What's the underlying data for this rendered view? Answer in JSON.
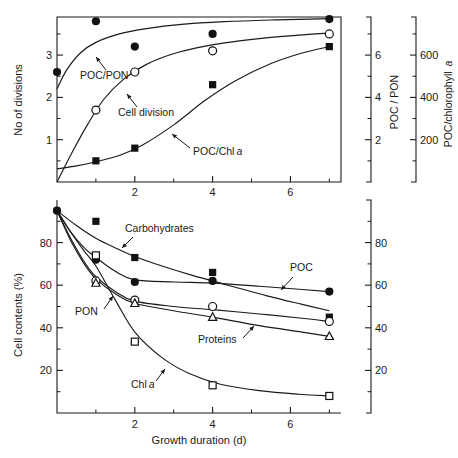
{
  "cut_header_text": "Verity 1981, Fig. 3",
  "figure": {
    "panels": [
      {
        "id": "top",
        "left_axis": {
          "title": "No of divisions",
          "ticks": [
            1,
            2,
            3
          ],
          "range": [
            0,
            3.9
          ]
        },
        "right_axis_1": {
          "title": "POC / PON",
          "ticks": [
            2,
            4,
            6
          ],
          "range": [
            0,
            7.8
          ]
        },
        "right_axis_2": {
          "title": "POC/chlorophyll a",
          "ticks": [
            200,
            400,
            600
          ],
          "range": [
            0,
            780
          ]
        },
        "x_axis": {
          "ticks": [
            2,
            4,
            6
          ],
          "range": [
            0,
            7.3
          ]
        },
        "annotations": [
          {
            "label": "POC/PON"
          },
          {
            "label": "Cell division"
          },
          {
            "label": "POC/Chl a",
            "italic_tail": "a"
          }
        ]
      },
      {
        "id": "bottom",
        "left_axis": {
          "title": "Cell contents (%)",
          "ticks": [
            20,
            40,
            60,
            80
          ],
          "range": [
            0,
            100
          ]
        },
        "right_axis": {
          "title": "",
          "ticks": [
            20,
            40,
            60,
            80
          ],
          "range": [
            0,
            100
          ]
        },
        "x_axis": {
          "title": "Growth duration (d)",
          "ticks": [
            2,
            4,
            6
          ],
          "range": [
            0,
            7.3
          ]
        },
        "annotations": [
          {
            "label": "Carbohydrates"
          },
          {
            "label": "POC"
          },
          {
            "label": "PON"
          },
          {
            "label": "Proteins"
          },
          {
            "label": "Chl a",
            "italic_tail": "a"
          }
        ]
      }
    ]
  },
  "chart_data": [
    {
      "type": "scatter",
      "id": "top-panel",
      "title": "",
      "xlabel": "",
      "ylabel": "No of divisions",
      "xlim": [
        0,
        7.3
      ],
      "ylim": [
        0,
        3.9
      ],
      "xticks": [
        2,
        4,
        6
      ],
      "yticks": [
        1,
        2,
        3
      ],
      "grid": false,
      "legend": "inline-annotations",
      "secondary_axes": [
        {
          "label": "POC / PON",
          "ticks": [
            2,
            4,
            6
          ],
          "lim": [
            0,
            7.8
          ]
        },
        {
          "label": "POC/chlorophyll a",
          "ticks": [
            200,
            400,
            600
          ],
          "lim": [
            0,
            780
          ]
        }
      ],
      "series": [
        {
          "name": "POC/PON",
          "marker": "filled-circle",
          "axis": "POC / PON",
          "x": [
            0,
            1,
            2,
            4,
            7
          ],
          "values": [
            5.2,
            7.6,
            6.4,
            7.0,
            7.7
          ],
          "curve_x": [
            0,
            0.25,
            0.6,
            1,
            1.6,
            2.3,
            3.2,
            4.3,
            5.5,
            6.5,
            7
          ],
          "curve_values": [
            4.4,
            5.3,
            6.1,
            6.6,
            7.0,
            7.25,
            7.45,
            7.58,
            7.66,
            7.7,
            7.72
          ]
        },
        {
          "name": "Cell division",
          "marker": "open-circle",
          "axis": "No of divisions",
          "x": [
            0,
            1,
            2,
            4,
            7
          ],
          "values": [
            0.0,
            1.7,
            2.6,
            3.1,
            3.5
          ],
          "curve_x": [
            0,
            0.4,
            0.8,
            1.2,
            1.7,
            2.3,
            3.1,
            4.1,
            5.2,
            6.2,
            7
          ],
          "curve_values": [
            0.0,
            0.72,
            1.38,
            1.95,
            2.42,
            2.78,
            3.06,
            3.26,
            3.39,
            3.47,
            3.52
          ]
        },
        {
          "name": "POC/Chl a",
          "marker": "filled-square",
          "axis": "POC/chlorophyll a",
          "x": [
            0,
            1,
            2,
            4,
            7
          ],
          "values": [
            40,
            100,
            160,
            460,
            640
          ],
          "curve_x": [
            0,
            0.5,
            1,
            1.6,
            2.2,
            3,
            3.8,
            4.6,
            5.5,
            6.3,
            7
          ],
          "curve_values": [
            62,
            76,
            96,
            125,
            175,
            270,
            385,
            480,
            560,
            610,
            640
          ]
        }
      ]
    },
    {
      "type": "scatter",
      "id": "bottom-panel",
      "title": "",
      "xlabel": "Growth duration (d)",
      "ylabel": "Cell contents (%)",
      "xlim": [
        0,
        7.3
      ],
      "ylim": [
        0,
        100
      ],
      "xticks": [
        2,
        4,
        6
      ],
      "yticks": [
        20,
        40,
        60,
        80
      ],
      "grid": false,
      "legend": "inline-annotations",
      "secondary_axes": [
        {
          "label": "",
          "ticks": [
            20,
            40,
            60,
            80
          ],
          "lim": [
            0,
            100
          ]
        }
      ],
      "series": [
        {
          "name": "Carbohydrates",
          "marker": "filled-square",
          "x": [
            0,
            1,
            2,
            4,
            7
          ],
          "values": [
            95,
            90,
            73,
            66,
            45
          ],
          "curve_x": [
            0,
            0.5,
            1,
            1.5,
            2,
            2.7,
            3.5,
            4.4,
            5.4,
            6.3,
            7
          ],
          "curve_values": [
            95,
            88,
            82,
            77.5,
            73.5,
            69,
            64.5,
            60,
            55,
            51,
            48
          ]
        },
        {
          "name": "POC",
          "marker": "filled-circle",
          "x": [
            0,
            1,
            2,
            4,
            7
          ],
          "values": [
            95,
            72,
            61.5,
            62,
            57
          ],
          "curve_x": [
            0,
            0.35,
            0.7,
            1,
            1.5,
            2,
            3,
            4,
            5.2,
            6.3,
            7
          ],
          "curve_values": [
            95,
            85,
            77.5,
            73,
            66.5,
            62.5,
            61.5,
            61,
            59.5,
            58,
            57
          ]
        },
        {
          "name": "PON",
          "marker": "open-circle",
          "x": [
            0,
            1,
            2,
            4,
            7
          ],
          "values": [
            95,
            62,
            53,
            50,
            43
          ],
          "curve_x": [
            0,
            0.35,
            0.7,
            1,
            1.5,
            2,
            3,
            4,
            5.2,
            6.3,
            7
          ],
          "curve_values": [
            95,
            82,
            71,
            64,
            57,
            52.5,
            50,
            48.5,
            46.5,
            44.5,
            43
          ]
        },
        {
          "name": "Proteins",
          "marker": "open-triangle",
          "x": [
            0,
            1,
            2,
            4,
            7
          ],
          "values": [
            95,
            61,
            51.5,
            45,
            36
          ],
          "curve_x": [
            0,
            0.35,
            0.7,
            1,
            1.5,
            2,
            3,
            4,
            5.2,
            6.3,
            7
          ],
          "curve_values": [
            95,
            81,
            70,
            63,
            56,
            51.5,
            48,
            45,
            41,
            38,
            36
          ]
        },
        {
          "name": "Chl a",
          "marker": "open-square",
          "x": [
            0,
            1,
            2,
            4,
            7
          ],
          "values": [
            95,
            74,
            33.5,
            13,
            8
          ],
          "curve_x": [
            0,
            0.35,
            0.7,
            1,
            1.5,
            2,
            2.7,
            3.4,
            4.2,
            5.2,
            6.2,
            7
          ],
          "curve_values": [
            95,
            85,
            76,
            69,
            53,
            38,
            26,
            18.5,
            13.5,
            10.5,
            8.8,
            8
          ]
        }
      ]
    }
  ],
  "colors": {
    "ink": "#1a1a1a",
    "background": "#ffffff",
    "faded_header": "#b9b9b9"
  }
}
